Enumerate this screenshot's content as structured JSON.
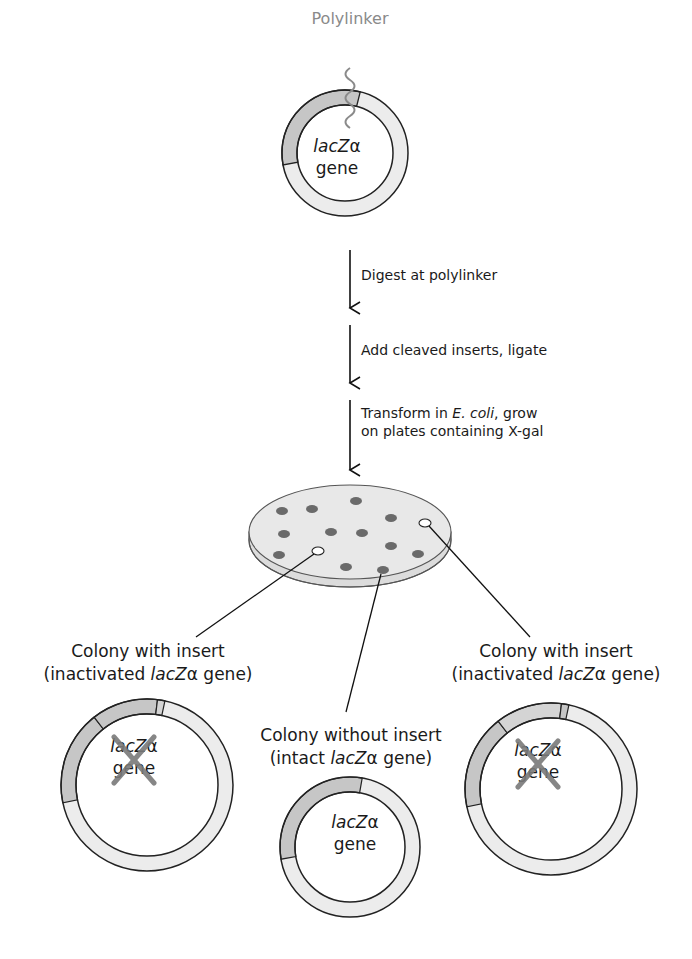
{
  "figure": {
    "polylinker_label": "Polylinker",
    "plasmid_top": {
      "gene_italic": "lacZ",
      "gene_greek": "α",
      "gene_word": "gene"
    },
    "steps": [
      {
        "line1_pre": "Digest at polylinker",
        "line1_italic": "",
        "line1_post": "",
        "line2": ""
      },
      {
        "line1_pre": "Add cleaved inserts, ligate",
        "line1_italic": "",
        "line1_post": "",
        "line2": ""
      },
      {
        "line1_pre": "Transform in ",
        "line1_italic": "E. coli",
        "line1_post": ", grow",
        "line2": "on plates containing X-gal"
      }
    ],
    "plate": {
      "blue_colonies": [
        [
          282,
          511
        ],
        [
          312,
          509
        ],
        [
          356,
          501
        ],
        [
          391,
          518
        ],
        [
          284,
          534
        ],
        [
          331,
          532
        ],
        [
          362,
          533
        ],
        [
          391,
          546
        ],
        [
          418,
          554
        ],
        [
          279,
          555
        ],
        [
          346,
          567
        ],
        [
          383,
          570
        ]
      ],
      "white_colonies": [
        [
          318,
          551
        ],
        [
          425,
          523
        ]
      ]
    },
    "outcomes": {
      "left": {
        "title": "Colony with insert",
        "sub_pre": "(inactivated ",
        "sub_italic": "lacZ",
        "sub_greek": "α",
        "sub_post": " gene)",
        "gene_italic": "lacZ",
        "gene_greek": "α",
        "gene_word": "gene",
        "inactivated": true
      },
      "middle": {
        "title": "Colony without insert",
        "sub_pre": "(intact ",
        "sub_italic": "lacZ",
        "sub_greek": "α",
        "sub_post": " gene)",
        "gene_italic": "lacZ",
        "gene_greek": "α",
        "gene_word": "gene",
        "inactivated": false
      },
      "right": {
        "title": "Colony with insert",
        "sub_pre": "(inactivated ",
        "sub_italic": "lacZ",
        "sub_greek": "α",
        "sub_post": " gene)",
        "gene_italic": "lacZ",
        "gene_greek": "α",
        "gene_word": "gene",
        "inactivated": true
      }
    },
    "colors": {
      "ring": "#ececec",
      "lacz_segment": "#c6c6c6",
      "insert_segment": "#d4d4d4",
      "outline": "#222222",
      "plate_top": "#e8e8e8",
      "plate_side": "#dcdcdc",
      "blue_colony": "#6a6a6a",
      "white_colony": "#ffffff",
      "cross": "#7a7a7a",
      "polylinker": "#8a8a8a"
    }
  }
}
